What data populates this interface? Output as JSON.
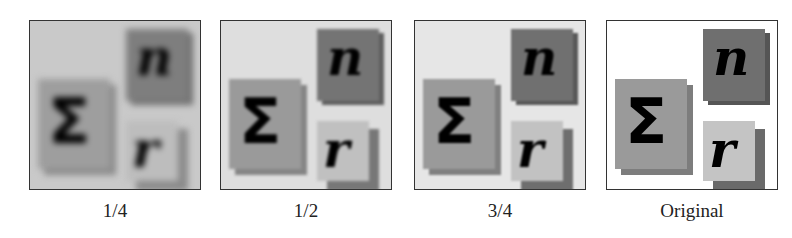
{
  "figure": {
    "panels": [
      {
        "id": "quarter",
        "caption": "1/4",
        "background": "#c9c9c9"
      },
      {
        "id": "half",
        "caption": "1/2",
        "background": "#dedede"
      },
      {
        "id": "three-quarter",
        "caption": "3/4",
        "background": "#e6e6e6"
      },
      {
        "id": "original",
        "caption": "Original",
        "background": "#ffffff"
      }
    ],
    "glyphs": {
      "sigma": "Σ",
      "n": "n",
      "r": "r"
    },
    "colors": {
      "sigma_box": "#9a9a9a",
      "sigma_shadow": "#7d7d7d",
      "n_box": "#6f6f6f",
      "n_shadow": "#555555",
      "r_box": "#c4c4c4",
      "r_shadow": "#6a6a6a",
      "frame": "#333333"
    }
  }
}
